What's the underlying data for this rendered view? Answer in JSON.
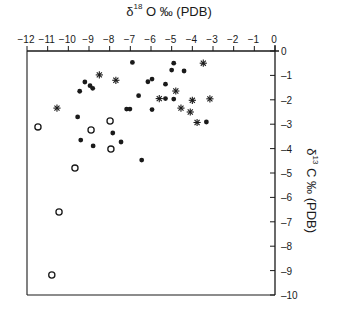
{
  "chart_data": {
    "type": "scatter",
    "title": "",
    "xlabel": "δ18O ‰ (PDB)",
    "xlabel_parts": {
      "symbol": "δ",
      "sup": "18",
      "rest": "O ‰ (PDB)"
    },
    "ylabel": "δ13C ‰ (PDB)",
    "ylabel_parts": {
      "symbol": "δ",
      "sup": "13",
      "rest": "C ‰ (PDB)"
    },
    "xlim": [
      -12,
      0
    ],
    "ylim": [
      -10,
      0
    ],
    "x_axis_position": "top",
    "y_axis_position": "right",
    "x_ticks": [
      "-12",
      "-11",
      "-10",
      "-9",
      "-8",
      "-7",
      "-6",
      "-5",
      "-4",
      "-3",
      "-2",
      "-1",
      "0"
    ],
    "y_ticks": [
      "0",
      "-1",
      "-2",
      "-3",
      "-4",
      "-5",
      "-6",
      "-7",
      "-8",
      "-9",
      "-10"
    ],
    "grid": false,
    "legend": null,
    "series": [
      {
        "name": "filled circles",
        "marker": "filled-circle",
        "points": [
          [
            -6.9,
            -0.47
          ],
          [
            -4.9,
            -0.5
          ],
          [
            -5.0,
            -0.78
          ],
          [
            -4.4,
            -0.82
          ],
          [
            -9.2,
            -1.27
          ],
          [
            -8.95,
            -1.42
          ],
          [
            -8.82,
            -1.53
          ],
          [
            -9.45,
            -1.65
          ],
          [
            -6.15,
            -1.26
          ],
          [
            -5.95,
            -1.15
          ],
          [
            -5.3,
            -1.36
          ],
          [
            -6.6,
            -1.83
          ],
          [
            -5.3,
            -1.95
          ],
          [
            -4.9,
            -1.97
          ],
          [
            -7.18,
            -2.38
          ],
          [
            -7.02,
            -2.38
          ],
          [
            -5.95,
            -2.4
          ],
          [
            -9.55,
            -2.7
          ],
          [
            -3.32,
            -2.91
          ],
          [
            -7.85,
            -3.36
          ],
          [
            -9.4,
            -3.65
          ],
          [
            -8.8,
            -3.89
          ],
          [
            -7.45,
            -3.73
          ],
          [
            -6.45,
            -4.47
          ]
        ]
      },
      {
        "name": "asterisks",
        "marker": "asterisk",
        "points": [
          [
            -8.5,
            -0.98
          ],
          [
            -7.7,
            -1.2
          ],
          [
            -3.47,
            -0.5
          ],
          [
            -4.8,
            -1.64
          ],
          [
            -5.6,
            -1.95
          ],
          [
            -4.0,
            -2.02
          ],
          [
            -3.15,
            -1.96
          ],
          [
            -4.55,
            -2.34
          ],
          [
            -4.1,
            -2.5
          ],
          [
            -3.77,
            -2.93
          ],
          [
            -10.55,
            -2.34
          ]
        ]
      },
      {
        "name": "open circles",
        "marker": "open-circle",
        "points": [
          [
            -11.47,
            -3.11
          ],
          [
            -8.9,
            -3.24
          ],
          [
            -7.98,
            -2.87
          ],
          [
            -7.94,
            -4.02
          ],
          [
            -9.68,
            -4.8
          ],
          [
            -10.45,
            -6.6
          ],
          [
            -10.8,
            -9.18
          ]
        ]
      }
    ]
  },
  "colors": {
    "ink": "#1a1a1a",
    "background": "#ffffff"
  }
}
